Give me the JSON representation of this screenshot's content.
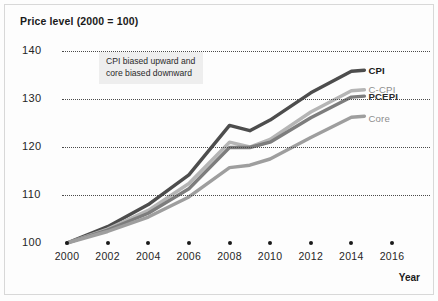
{
  "figure": {
    "title": "Price level (2000 = 100)",
    "axis_label_x": "Year",
    "annotation": "CPI biased upward and core biased downward"
  },
  "chart_data": {
    "type": "line",
    "title": "Price level (2000 = 100)",
    "xlabel": "Year",
    "ylabel": "Price level (2000 = 100)",
    "xlim": [
      2000,
      2016
    ],
    "ylim": [
      100,
      142
    ],
    "grid": true,
    "grid_style": "dotted-horizontal",
    "legend_position": "right-of-line-ends",
    "x": [
      2000,
      2002,
      2004,
      2006,
      2008,
      2009,
      2010,
      2012,
      2014,
      2016
    ],
    "yticks": [
      100,
      110,
      120,
      130,
      140
    ],
    "xticks": [
      2000,
      2002,
      2004,
      2006,
      2008,
      2010,
      2012,
      2014,
      2016
    ],
    "annotations": [
      {
        "text": "CPI biased upward and core biased downward",
        "x": 2003.2,
        "y": 137.5
      }
    ],
    "series": [
      {
        "name": "CPI",
        "color": "#4d4d4d",
        "width": 3.4,
        "values": [
          100.0,
          103.4,
          108.0,
          114.2,
          124.5,
          123.4,
          125.6,
          131.3,
          135.8,
          137.8
        ]
      },
      {
        "name": "C-CPI",
        "color": "#b5b5b5",
        "width": 3.4,
        "values": [
          100.0,
          102.9,
          106.8,
          112.4,
          121.0,
          120.0,
          121.6,
          127.3,
          131.7,
          133.2
        ]
      },
      {
        "name": "PCEPI",
        "color": "#7d7d7d",
        "width": 3.4,
        "values": [
          100.0,
          102.7,
          106.2,
          111.3,
          119.9,
          119.9,
          121.0,
          126.1,
          130.4,
          131.6
        ]
      },
      {
        "name": "Core",
        "color": "#9e9e9e",
        "width": 3.4,
        "values": [
          100.0,
          102.4,
          105.4,
          109.6,
          115.7,
          116.2,
          117.5,
          122.0,
          126.2,
          129.2
        ]
      }
    ]
  }
}
